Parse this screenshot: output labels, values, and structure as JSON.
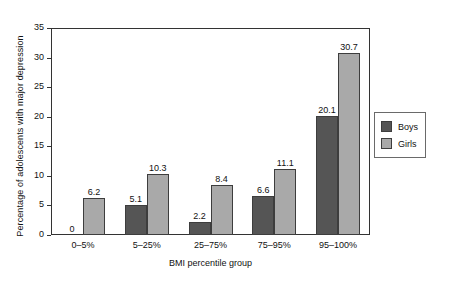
{
  "chart_data": {
    "type": "bar",
    "title": "",
    "subtitle": "",
    "xlabel": "BMI percentile group",
    "ylabel": "Percentage of adolescents with major depression",
    "categories": [
      "0–5%",
      "5–25%",
      "25–75%",
      "75–95%",
      "95–100%"
    ],
    "series": [
      {
        "name": "Boys",
        "color": "#555555",
        "values": [
          0,
          5.1,
          2.2,
          6.6,
          20.1
        ]
      },
      {
        "name": "Girls",
        "color": "#a9a9a9",
        "values": [
          6.2,
          10.3,
          8.4,
          11.1,
          30.7
        ]
      }
    ],
    "value_labels": {
      "boys": [
        "0",
        "5.1",
        "2.2",
        "6.6",
        "20.1"
      ],
      "girls": [
        "6.2",
        "10.3",
        "8.4",
        "11.1",
        "30.7"
      ]
    },
    "ylim": [
      0,
      35
    ],
    "yticks": [
      0,
      5,
      10,
      15,
      20,
      25,
      30,
      35
    ],
    "ytick_labels": [
      "0",
      "5",
      "10",
      "15",
      "20",
      "25",
      "30",
      "35"
    ],
    "grid": false,
    "legend_position": "right-middle",
    "legend_entries": [
      "Boys",
      "Girls"
    ]
  },
  "axes": {
    "y_title": "Percentage of adolescents with major depression",
    "x_title": "BMI percentile group"
  },
  "legend": {
    "items": [
      {
        "label": "Boys",
        "color": "#555555"
      },
      {
        "label": "Girls",
        "color": "#a9a9a9"
      }
    ]
  }
}
